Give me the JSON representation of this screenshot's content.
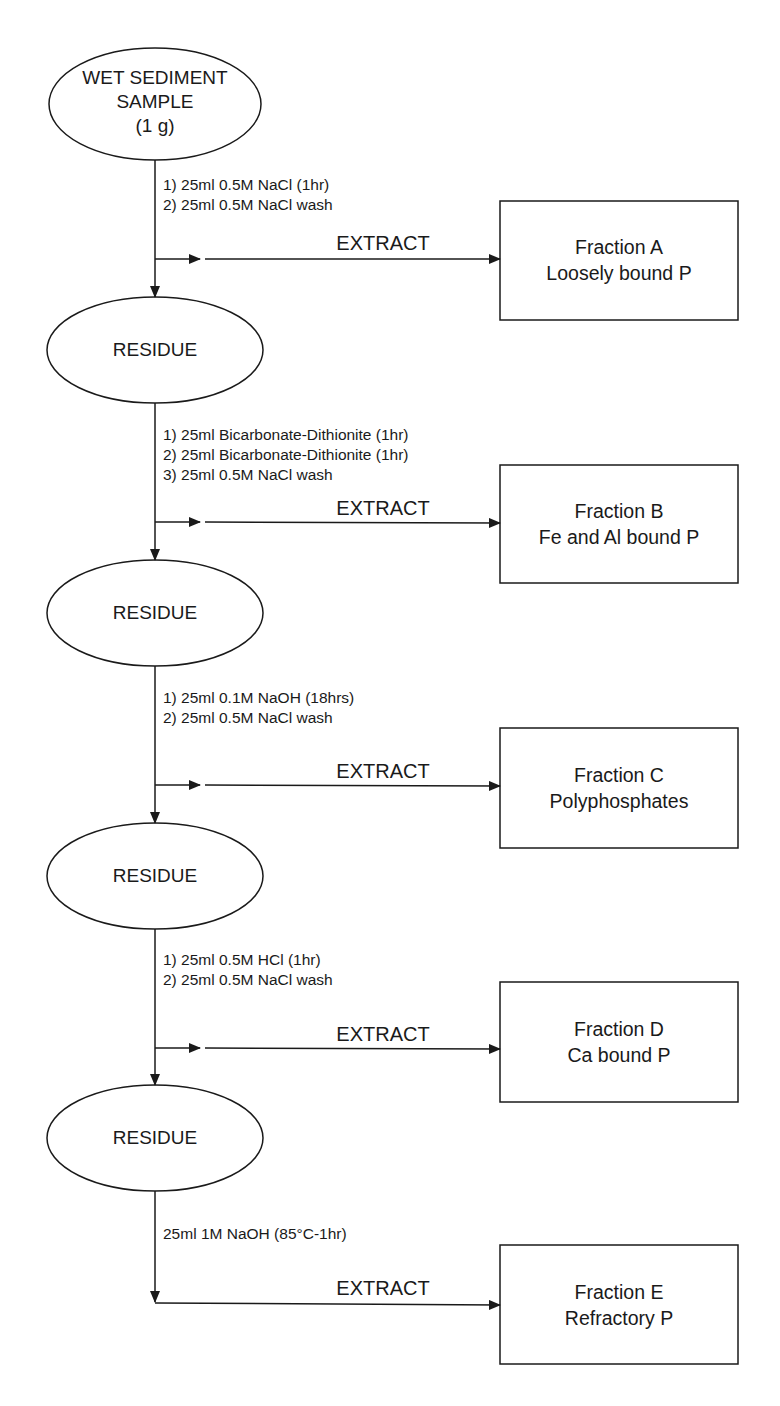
{
  "start_node": {
    "lines": [
      "WET SEDIMENT",
      "SAMPLE",
      "(1 g)"
    ]
  },
  "residue_label": "RESIDUE",
  "extract_label": "EXTRACT",
  "steps": [
    {
      "reagents": [
        "1) 25ml 0.5M NaCl (1hr)",
        "2) 25ml 0.5M NaCl wash"
      ],
      "fraction": {
        "name": "Fraction A",
        "description": "Loosely bound P"
      }
    },
    {
      "reagents": [
        "1) 25ml Bicarbonate-Dithionite (1hr)",
        "2) 25ml Bicarbonate-Dithionite (1hr)",
        "3) 25ml 0.5M NaCl wash"
      ],
      "fraction": {
        "name": "Fraction B",
        "description": "Fe and Al bound P"
      }
    },
    {
      "reagents": [
        "1) 25ml 0.1M NaOH (18hrs)",
        "2) 25ml 0.5M NaCl wash"
      ],
      "fraction": {
        "name": "Fraction C",
        "description": "Polyphosphates"
      }
    },
    {
      "reagents": [
        "1) 25ml 0.5M HCl (1hr)",
        "2) 25ml 0.5M NaCl wash"
      ],
      "fraction": {
        "name": "Fraction D",
        "description": "Ca bound P"
      }
    },
    {
      "reagents": [
        "25ml 1M NaOH (85°C-1hr)"
      ],
      "fraction": {
        "name": "Fraction E",
        "description": "Refractory P"
      }
    }
  ],
  "colors": {
    "line": "#1a1a1a",
    "background": "#ffffff"
  }
}
